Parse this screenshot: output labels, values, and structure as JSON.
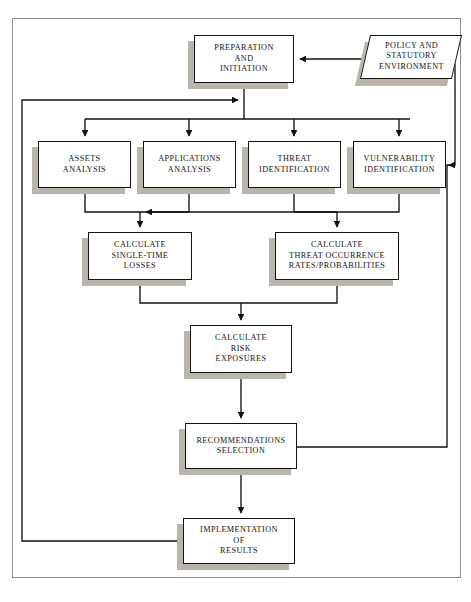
{
  "diagram": {
    "frame": {
      "border_color": "#8d8d8d"
    },
    "colors": {
      "box_border": "#14110f",
      "box_fill": "#ffffff",
      "shadow": "#b9b5ad",
      "line": "#14110f",
      "page": "#ffffff"
    },
    "nodes": [
      {
        "id": "preparation",
        "label": "PREPARATION\nAND\nINITIATION",
        "shape": "rectangle",
        "x": 194,
        "y": 35,
        "w": 100,
        "h": 48
      },
      {
        "id": "policy",
        "label": "POLICY AND\nSTATUTORY\nENVIRONMENT",
        "shape": "parallelogram",
        "x": 365,
        "y": 35,
        "w": 92,
        "h": 44
      },
      {
        "id": "assets",
        "label": "ASSETS\nANALYSIS",
        "shape": "rectangle",
        "x": 38,
        "y": 141,
        "w": 93,
        "h": 47
      },
      {
        "id": "applications",
        "label": "APPLICATIONS\nANALYSIS",
        "shape": "rectangle",
        "x": 143,
        "y": 141,
        "w": 93,
        "h": 47
      },
      {
        "id": "threat",
        "label": "THREAT\nIDENTIFICATION",
        "shape": "rectangle",
        "x": 248,
        "y": 141,
        "w": 93,
        "h": 47
      },
      {
        "id": "vulnerability",
        "label": "VULNERABILITY\nIDENTIFICATION",
        "shape": "rectangle",
        "x": 353,
        "y": 141,
        "w": 93,
        "h": 47
      },
      {
        "id": "calc-single-time",
        "label": "CALCULATE\nSINGLE-TIME\nLOSSES",
        "shape": "rectangle",
        "x": 88,
        "y": 232,
        "w": 104,
        "h": 48
      },
      {
        "id": "calc-threat-occurrence",
        "label": "CALCULATE\nTHREAT OCCURRENCE\nRATES/PROBABILITIES",
        "shape": "rectangle",
        "x": 275,
        "y": 232,
        "w": 124,
        "h": 48
      },
      {
        "id": "calc-risk-exposures",
        "label": "CALCULATE\nRISK\nEXPOSURES",
        "shape": "rectangle",
        "x": 190,
        "y": 325,
        "w": 102,
        "h": 48
      },
      {
        "id": "recommendations",
        "label": "RECOMMENDATIONS\nSELECTION",
        "shape": "rectangle",
        "x": 185,
        "y": 423,
        "w": 112,
        "h": 46
      },
      {
        "id": "implementation",
        "label": "IMPLEMENTATION\nOF\nRESULTS",
        "shape": "rectangle",
        "x": 183,
        "y": 518,
        "w": 112,
        "h": 46
      }
    ],
    "connectors": [
      {
        "id": "policy-to-preparation",
        "from": "policy",
        "to": "preparation",
        "arrow": true
      },
      {
        "id": "preparation-to-bus",
        "from": "preparation",
        "to": "distribution-bus",
        "arrow": false
      },
      {
        "id": "bus-to-assets",
        "from": "distribution-bus",
        "to": "assets",
        "arrow": true
      },
      {
        "id": "bus-to-applications",
        "from": "distribution-bus",
        "to": "applications",
        "arrow": true
      },
      {
        "id": "bus-to-threat",
        "from": "distribution-bus",
        "to": "threat",
        "arrow": true
      },
      {
        "id": "bus-to-vulnerability",
        "from": "distribution-bus",
        "to": "vulnerability",
        "arrow": true
      },
      {
        "id": "assets-applications-to-calc-single",
        "from": "assets+applications",
        "to": "calc-single-time",
        "arrow": true
      },
      {
        "id": "threat-vulnerability-to-calc-threat",
        "from": "threat+vulnerability",
        "to": "calc-threat-occurrence",
        "arrow": true
      },
      {
        "id": "calc-merge-to-risk",
        "from": "calc-single-time+calc-threat-occurrence",
        "to": "calc-risk-exposures",
        "arrow": true
      },
      {
        "id": "risk-to-recommendations",
        "from": "calc-risk-exposures",
        "to": "recommendations",
        "arrow": true
      },
      {
        "id": "recommendations-to-implementation",
        "from": "recommendations",
        "to": "implementation",
        "arrow": true
      },
      {
        "id": "recommendations-feedback-right",
        "from": "recommendations",
        "to": "vulnerability",
        "arrow": true
      },
      {
        "id": "policy-feedback-right",
        "from": "policy",
        "to": "vulnerability",
        "arrow": true
      },
      {
        "id": "implementation-feedback-left",
        "from": "implementation",
        "to": "preparation-bus",
        "arrow": true
      }
    ]
  }
}
